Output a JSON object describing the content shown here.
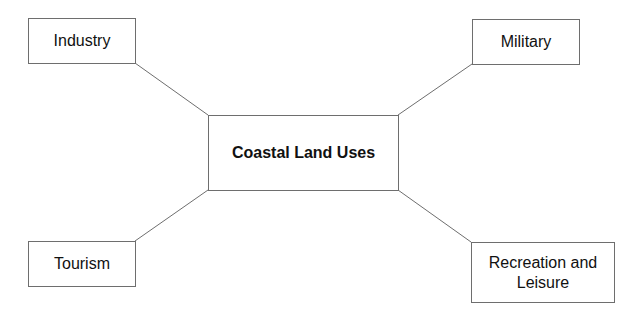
{
  "diagram": {
    "center": {
      "label": "Coastal Land Uses"
    },
    "nodes": [
      {
        "id": "industry",
        "label": "Industry"
      },
      {
        "id": "military",
        "label": "Military"
      },
      {
        "id": "tourism",
        "label": "Tourism"
      },
      {
        "id": "recreation",
        "label": "Recreation and Leisure"
      }
    ],
    "edges": [
      {
        "from": "center",
        "to": "industry"
      },
      {
        "from": "center",
        "to": "military"
      },
      {
        "from": "center",
        "to": "tourism"
      },
      {
        "from": "center",
        "to": "recreation"
      }
    ],
    "colors": {
      "line": "#6e6e6e",
      "border": "#6e6e6e",
      "text": "#111111",
      "background": "#ffffff"
    }
  }
}
